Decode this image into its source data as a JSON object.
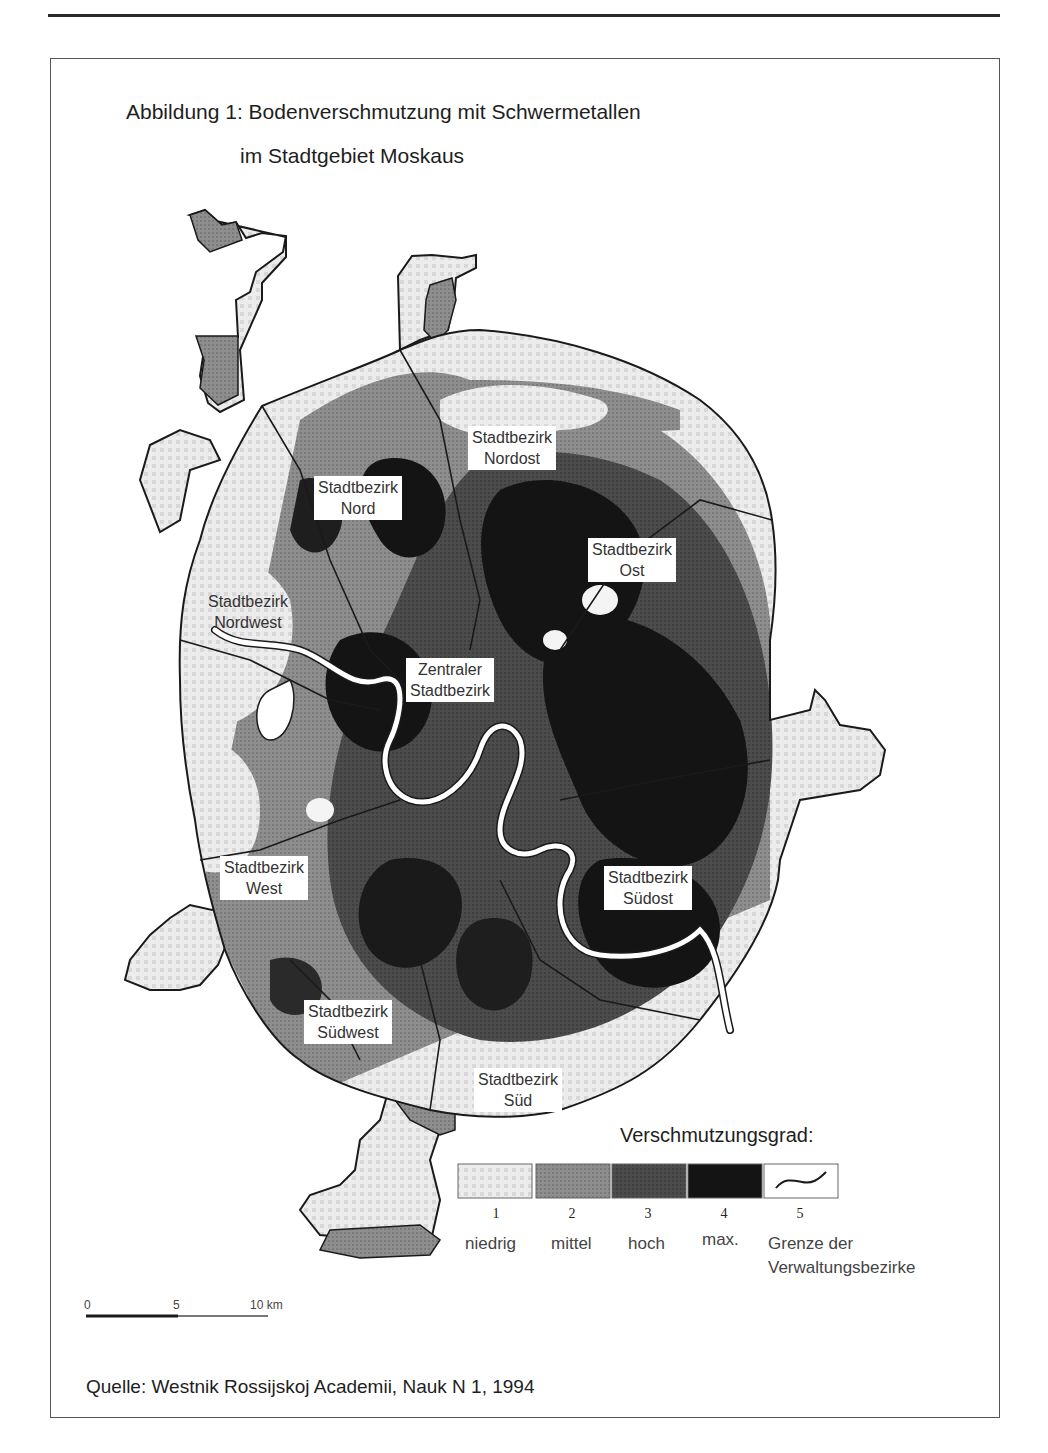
{
  "figure": {
    "title_line1": "Abbildung 1: Bodenverschmutzung mit Schwermetallen",
    "title_line2": "im Stadtgebiet Moskaus"
  },
  "districts": [
    {
      "line1": "Stadtbezirk",
      "line2": "Nordost"
    },
    {
      "line1": "Stadtbezirk",
      "line2": "Nord"
    },
    {
      "line1": "Stadtbezirk",
      "line2": "Ost"
    },
    {
      "line1": "Stadtbezirk",
      "line2": "Nordwest"
    },
    {
      "line1": "Zentraler",
      "line2": "Stadtbezirk"
    },
    {
      "line1": "Stadtbezirk",
      "line2": "West"
    },
    {
      "line1": "Stadtbezirk",
      "line2": "Südost"
    },
    {
      "line1": "Stadtbezirk",
      "line2": "Südwest"
    },
    {
      "line1": "Stadtbezirk",
      "line2": "Süd"
    }
  ],
  "legend": {
    "title": "Verschmutzungsgrad:",
    "items": [
      {
        "number": "1",
        "label": "niedrig",
        "color": "#e8e8e8"
      },
      {
        "number": "2",
        "label": "mittel",
        "color": "#8c8c8c"
      },
      {
        "number": "3",
        "label": "hoch",
        "color": "#4a4a4a"
      },
      {
        "number": "4",
        "label": "max.",
        "color": "#141414"
      },
      {
        "number": "5",
        "label_line1": "Grenze der",
        "label_line2": "Verwaltungsbezirke",
        "color": "#ffffff"
      }
    ]
  },
  "scale_bar": {
    "ticks": [
      "0",
      "5",
      "10 km"
    ]
  },
  "source": "Quelle: Westnik Rossijskoj Academii, Nauk N 1, 1994",
  "colors": {
    "level1": "#e8e8e8",
    "level2": "#8c8c8c",
    "level3": "#4a4a4a",
    "level4": "#141414",
    "river": "#ffffff",
    "border": "#1a1a1a"
  }
}
